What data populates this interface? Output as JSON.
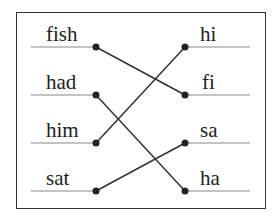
{
  "diagram": {
    "type": "matching-exercise",
    "left_words": [
      "fish",
      "had",
      "him",
      "sat"
    ],
    "right_words": [
      "hi",
      "fi",
      "sa",
      "ha"
    ],
    "connections": [
      {
        "from": "fish",
        "to": "fi"
      },
      {
        "from": "had",
        "to": "ha"
      },
      {
        "from": "him",
        "to": "hi"
      },
      {
        "from": "sat",
        "to": "sa"
      }
    ],
    "colors": {
      "line": "#333333",
      "text": "#222222",
      "underline": "#888888"
    }
  }
}
